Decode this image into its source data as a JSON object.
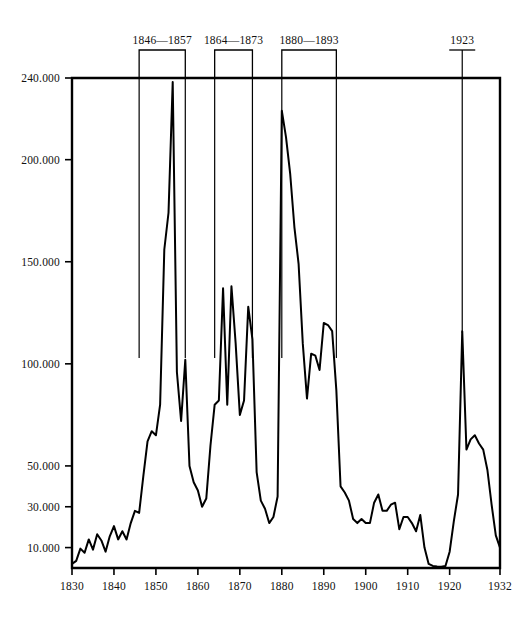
{
  "chart_data": {
    "type": "line",
    "title": "",
    "xlabel": "",
    "ylabel": "",
    "xlim": [
      1830,
      1932
    ],
    "ylim": [
      0,
      240000
    ],
    "grid": false,
    "legend_position": "none",
    "x_tick_labels": [
      "1830",
      "1840",
      "1850",
      "1860",
      "1870",
      "1880",
      "1890",
      "1900",
      "1910",
      "1920",
      "1932"
    ],
    "x_tick_values": [
      1830,
      1840,
      1850,
      1860,
      1870,
      1880,
      1890,
      1900,
      1910,
      1920,
      1932
    ],
    "y_tick_labels": [
      "10.000",
      "30.000",
      "50.000",
      "100.000",
      "150.000",
      "200.000",
      "240.000"
    ],
    "y_tick_values": [
      10000,
      30000,
      50000,
      100000,
      150000,
      200000,
      240000
    ],
    "series": [
      {
        "name": "",
        "x": [
          1830,
          1831,
          1832,
          1833,
          1834,
          1835,
          1836,
          1837,
          1838,
          1839,
          1840,
          1841,
          1842,
          1843,
          1844,
          1845,
          1846,
          1847,
          1848,
          1849,
          1850,
          1851,
          1852,
          1853,
          1854,
          1855,
          1856,
          1857,
          1858,
          1859,
          1860,
          1861,
          1862,
          1863,
          1864,
          1865,
          1866,
          1867,
          1868,
          1869,
          1870,
          1871,
          1872,
          1873,
          1874,
          1875,
          1876,
          1877,
          1878,
          1879,
          1880,
          1881,
          1882,
          1883,
          1884,
          1885,
          1886,
          1887,
          1888,
          1889,
          1890,
          1891,
          1892,
          1893,
          1894,
          1895,
          1896,
          1897,
          1898,
          1899,
          1900,
          1901,
          1902,
          1903,
          1904,
          1905,
          1906,
          1907,
          1908,
          1909,
          1910,
          1911,
          1912,
          1913,
          1914,
          1915,
          1916,
          1917,
          1918,
          1919,
          1920,
          1921,
          1922,
          1923,
          1924,
          1925,
          1926,
          1927,
          1928,
          1929,
          1930,
          1931,
          1932
        ],
        "y": [
          2000,
          3500,
          9500,
          7500,
          14000,
          9000,
          16500,
          13500,
          8000,
          15500,
          20500,
          14000,
          18000,
          14000,
          22000,
          28000,
          27000,
          45000,
          62000,
          67000,
          65000,
          80000,
          156000,
          174000,
          238000,
          96000,
          72000,
          102000,
          50000,
          42000,
          38000,
          30000,
          34000,
          60000,
          80000,
          82000,
          137000,
          80000,
          138000,
          110000,
          75000,
          82000,
          128000,
          112000,
          47000,
          33000,
          29000,
          22000,
          25000,
          35000,
          224000,
          211000,
          193000,
          167000,
          149000,
          110000,
          83000,
          105000,
          104000,
          97000,
          120000,
          119000,
          116000,
          87000,
          40000,
          37000,
          33000,
          24000,
          22000,
          24000,
          22000,
          22000,
          32000,
          36000,
          28000,
          28000,
          31000,
          32000,
          19000,
          25000,
          25000,
          22000,
          18000,
          26000,
          10000,
          2000,
          1000,
          700,
          600,
          1000,
          8000,
          23000,
          36000,
          116000,
          58000,
          63000,
          65000,
          61000,
          58000,
          48000,
          31000,
          16000,
          10000
        ]
      }
    ],
    "annotations": [
      {
        "label": "1846—1857",
        "type": "bracket",
        "start": 1846,
        "end": 1857
      },
      {
        "label": "1864—1873",
        "type": "bracket",
        "start": 1864,
        "end": 1873
      },
      {
        "label": "1880—1893",
        "type": "bracket",
        "start": 1880,
        "end": 1893
      },
      {
        "label": "1923",
        "type": "marker",
        "start": 1923,
        "end": 1923
      }
    ],
    "colors": {
      "curve": "#000000",
      "axis": "#000000",
      "background": "#ffffff"
    }
  }
}
